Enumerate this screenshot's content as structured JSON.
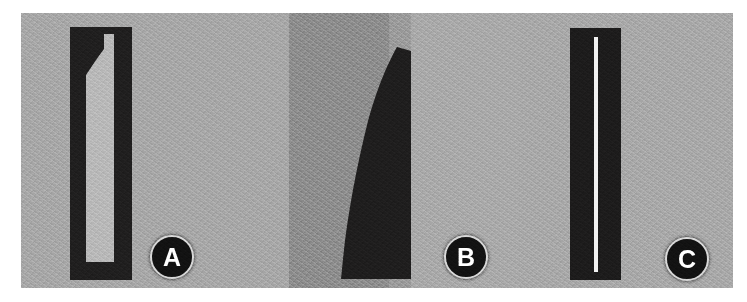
{
  "figure": {
    "name": "three-panel-grayscale-specimen-figure",
    "panel_count": 3,
    "background_color": "#a9a9a9",
    "page_margin_color": "#ffffff"
  },
  "panels": [
    {
      "id": "A",
      "label": "A",
      "badge_letter": "A",
      "background_color": "#a8a8a8",
      "specimen": {
        "name": "stepped-channel-section",
        "fill_color": "#201f1f",
        "channel_color": "#b8b8b8",
        "description": "dark rectangular bar with a white internal channel, narrow at the top and stepping wider below"
      }
    },
    {
      "id": "B",
      "label": "B",
      "badge_letter": "B",
      "background_color": "#aaaaaa",
      "band_color": "#8e8e8e",
      "specimen": {
        "name": "curved-blade-section",
        "fill_color": "#1f1e1e",
        "channel_color": "",
        "description": "solid dark curved blade shape with a straight right edge and a tapering pointed tip at the top"
      }
    },
    {
      "id": "C",
      "label": "C",
      "badge_letter": "C",
      "background_color": "#a9a9a9",
      "specimen": {
        "name": "thin-line-section",
        "fill_color": "#1d1c1c",
        "channel_color": "#f2f2f2",
        "description": "dark rectangular bar with a thin white vertical line running nearly its full height"
      }
    }
  ]
}
